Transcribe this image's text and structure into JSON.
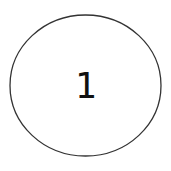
{
  "diagram": {
    "nodes": [
      {
        "id": "node-1",
        "shape": "ellipse",
        "label": "1",
        "stroke": "#333333",
        "fill": "#ffffff"
      }
    ]
  }
}
